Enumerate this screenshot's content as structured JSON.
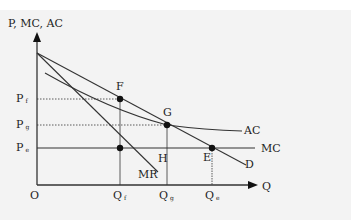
{
  "diagram": {
    "y_axis_label": "P, MC, AC",
    "x_axis_label": "Q",
    "origin_label": "O",
    "price_labels": [
      {
        "main": "P",
        "sub": "f"
      },
      {
        "main": "P",
        "sub": "g"
      },
      {
        "main": "P",
        "sub": "e"
      }
    ],
    "quantity_labels": [
      {
        "main": "Q",
        "sub": "f"
      },
      {
        "main": "Q",
        "sub": "g"
      },
      {
        "main": "Q",
        "sub": "e"
      }
    ],
    "points": [
      "F",
      "G",
      "H",
      "E"
    ],
    "curves": {
      "ac": "AC",
      "mc": "MC",
      "mr": "MR",
      "d": "D"
    },
    "colors": {
      "line": "#333333",
      "background": "#f3f3f3"
    }
  }
}
